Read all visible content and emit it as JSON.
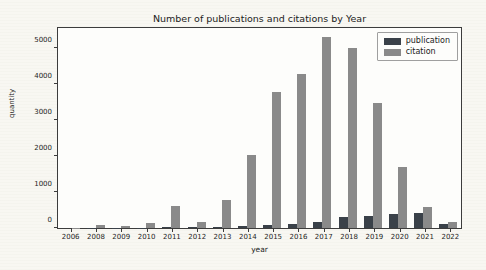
{
  "figure": {
    "title": "Number of publications and citations by Year",
    "xlabel": "year",
    "ylabel": "quantity"
  },
  "colors": {
    "publication": "#3a4149",
    "citation": "#8a8a8a",
    "axis": "#3c3c3c",
    "figure_background": "#f8f7f2",
    "plot_background": "#fdfdfb"
  },
  "legend": {
    "position": "upper right",
    "items": [
      {
        "label": "publication",
        "color": "#3a4149"
      },
      {
        "label": "citation",
        "color": "#8a8a8a"
      }
    ]
  },
  "chart_data": {
    "type": "bar",
    "title": "Number of publications and citations by Year",
    "xlabel": "year",
    "ylabel": "quantity",
    "grid": false,
    "legend_position": "upper right",
    "categories": [
      "2006",
      "2008",
      "2009",
      "2010",
      "2011",
      "2012",
      "2013",
      "2014",
      "2015",
      "2016",
      "2017",
      "2018",
      "2019",
      "2020",
      "2021",
      "2022"
    ],
    "series": [
      {
        "name": "publication",
        "color": "#3a4149",
        "values": [
          2,
          5,
          5,
          8,
          15,
          15,
          25,
          55,
          90,
          120,
          180,
          300,
          350,
          390,
          430,
          115
        ]
      },
      {
        "name": "citation",
        "color": "#8a8a8a",
        "values": [
          10,
          80,
          45,
          150,
          630,
          160,
          780,
          2050,
          3800,
          4300,
          5350,
          5050,
          3500,
          1700,
          580,
          170
        ]
      }
    ],
    "ylim": [
      0,
      5600
    ],
    "yticks": [
      0,
      1000,
      2000,
      3000,
      4000,
      5000
    ]
  }
}
